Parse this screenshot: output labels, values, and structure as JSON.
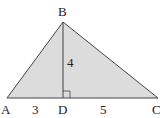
{
  "diagram": {
    "type": "triangle-with-altitude",
    "fill_color": "#dcdcdc",
    "stroke_color": "#444444",
    "vertices": {
      "A": {
        "label": "A",
        "x": 7,
        "y": 98
      },
      "B": {
        "label": "B",
        "x": 63,
        "y": 22
      },
      "C": {
        "label": "C",
        "x": 158,
        "y": 98
      },
      "D": {
        "label": "D",
        "x": 63,
        "y": 98
      }
    },
    "segments": [
      {
        "from": "A",
        "to": "B"
      },
      {
        "from": "B",
        "to": "C"
      },
      {
        "from": "A",
        "to": "C"
      },
      {
        "from": "B",
        "to": "D",
        "role": "altitude"
      }
    ],
    "measurements": {
      "BD": "4",
      "AD": "3",
      "DC": "5"
    },
    "right_angle_at": "D"
  }
}
